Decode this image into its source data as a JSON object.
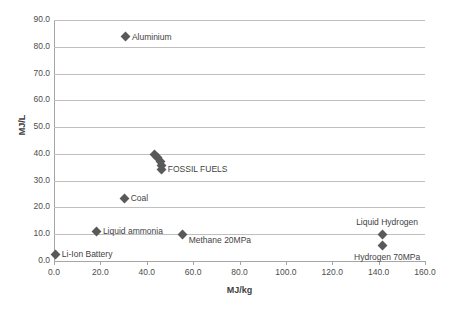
{
  "chart_data": {
    "type": "scatter",
    "title": "",
    "xlabel": "MJ/kg",
    "ylabel": "MJ/L",
    "xlim": [
      0.0,
      160.0
    ],
    "ylim": [
      0.0,
      90.0
    ],
    "xticks": [
      "0.0",
      "20.0",
      "40.0",
      "60.0",
      "80.0",
      "100.0",
      "120.0",
      "140.0",
      "160.0"
    ],
    "xtick_values": [
      0,
      20,
      40,
      60,
      80,
      100,
      120,
      140,
      160
    ],
    "yticks": [
      "0.0",
      "10.0",
      "20.0",
      "30.0",
      "40.0",
      "50.0",
      "60.0",
      "70.0",
      "80.0",
      "90.0"
    ],
    "ytick_values": [
      0,
      10,
      20,
      30,
      40,
      50,
      60,
      70,
      80,
      90
    ],
    "grid": "horizontal",
    "legend": "none",
    "marker_color": "#595959",
    "marker_shape": "diamond",
    "gridline_color": "#bfbfbf",
    "points": [
      {
        "label": "Aluminium",
        "x": 31.0,
        "y": 83.8,
        "label_pos": "right"
      },
      {
        "label": "",
        "x": 43.5,
        "y": 39.8,
        "label_pos": "none"
      },
      {
        "label": "",
        "x": 44.5,
        "y": 38.8,
        "label_pos": "none"
      },
      {
        "label": "",
        "x": 45.8,
        "y": 37.2,
        "label_pos": "none"
      },
      {
        "label": "",
        "x": 46.2,
        "y": 35.8,
        "label_pos": "none"
      },
      {
        "label": "FOSSIL FUELS",
        "x": 46.5,
        "y": 34.2,
        "label_pos": "right"
      },
      {
        "label": "Coal",
        "x": 30.5,
        "y": 23.5,
        "label_pos": "right"
      },
      {
        "label": "Liquid ammonia",
        "x": 18.5,
        "y": 11.1,
        "label_pos": "right"
      },
      {
        "label": "Methane 20MPa",
        "x": 55.5,
        "y": 10.0,
        "label_pos": "rightbelow"
      },
      {
        "label": "Liquid Hydrogen",
        "x": 141.5,
        "y": 10.0,
        "label_pos": "above"
      },
      {
        "label": "Hydrogen 70MPa",
        "x": 141.5,
        "y": 5.8,
        "label_pos": "below"
      },
      {
        "label": "Li-Ion Battery",
        "x": 0.8,
        "y": 2.5,
        "label_pos": "right"
      }
    ]
  }
}
